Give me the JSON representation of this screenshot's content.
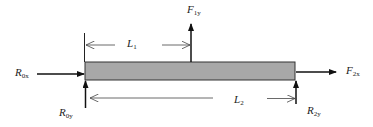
{
  "diagram": {
    "type": "free-body-diagram",
    "beam": {
      "fill": "#a8a8a8",
      "stroke": "#333333"
    },
    "forces": [
      {
        "id": "R0x",
        "symbol": "R",
        "subscript": "0x",
        "direction": "right",
        "acts_at": "left end"
      },
      {
        "id": "R0y",
        "symbol": "R",
        "subscript": "0y",
        "direction": "up",
        "acts_at": "left end"
      },
      {
        "id": "F1y",
        "symbol": "F",
        "subscript": "1y",
        "direction": "up",
        "acts_at": "L1 from left end"
      },
      {
        "id": "F2x",
        "symbol": "F",
        "subscript": "2x",
        "direction": "right",
        "acts_at": "right end"
      },
      {
        "id": "R2y",
        "symbol": "R",
        "subscript": "2y",
        "direction": "up",
        "acts_at": "right end"
      }
    ],
    "dimensions": [
      {
        "id": "L1",
        "symbol": "L",
        "subscript": "1",
        "from": "left end",
        "to": "F1y"
      },
      {
        "id": "L2",
        "symbol": "L",
        "subscript": "2",
        "from": "left end",
        "to": "right end"
      }
    ]
  },
  "labels": {
    "R0x": {
      "main": "R",
      "sub": "0x"
    },
    "R0y": {
      "main": "R",
      "sub": "0y"
    },
    "F1y": {
      "main": "F",
      "sub": "1y"
    },
    "F2x": {
      "main": "F",
      "sub": "2x"
    },
    "R2y": {
      "main": "R",
      "sub": "2y"
    },
    "L1": {
      "main": "L",
      "sub": "1"
    },
    "L2": {
      "main": "L",
      "sub": "2"
    }
  }
}
